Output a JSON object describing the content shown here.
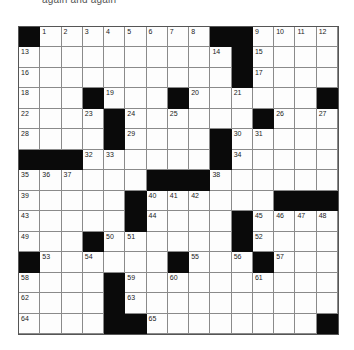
{
  "caption": "again and again",
  "grid": {
    "rows": 15,
    "cols": 15,
    "layout": [
      [
        "#",
        "1",
        "2",
        "3",
        "4",
        "5",
        "6",
        "7",
        "8",
        "#",
        "#",
        "9",
        "10",
        "11",
        "12"
      ],
      [
        "13",
        ".",
        ".",
        ".",
        ".",
        ".",
        ".",
        ".",
        ".",
        "14",
        "#",
        "15",
        ".",
        ".",
        "."
      ],
      [
        "16",
        ".",
        ".",
        ".",
        ".",
        ".",
        ".",
        ".",
        ".",
        ".",
        "#",
        "17",
        ".",
        ".",
        "."
      ],
      [
        "18",
        ".",
        ".",
        "#",
        "19",
        ".",
        ".",
        "#",
        "20",
        ".",
        "21",
        ".",
        ".",
        ".",
        "#"
      ],
      [
        "22",
        ".",
        ".",
        "23",
        "#",
        "24",
        ".",
        "25",
        ".",
        ".",
        ".",
        "#",
        "26",
        ".",
        "27"
      ],
      [
        "28",
        ".",
        ".",
        ".",
        "#",
        "29",
        ".",
        ".",
        ".",
        "#",
        "30",
        "31",
        ".",
        ".",
        "."
      ],
      [
        "#",
        "#",
        "#",
        "32",
        "33",
        ".",
        ".",
        ".",
        ".",
        "#",
        "34",
        ".",
        ".",
        ".",
        "."
      ],
      [
        "35",
        "36",
        "37",
        ".",
        ".",
        ".",
        "#",
        "#",
        "#",
        "38",
        ".",
        ".",
        ".",
        ".",
        "."
      ],
      [
        "39",
        ".",
        ".",
        ".",
        ".",
        "#",
        "40",
        "41",
        "42",
        ".",
        ".",
        ".",
        "#",
        "#",
        "#"
      ],
      [
        "43",
        ".",
        ".",
        ".",
        ".",
        "#",
        "44",
        ".",
        ".",
        ".",
        "#",
        "45",
        "46",
        "47",
        "48"
      ],
      [
        "49",
        ".",
        ".",
        "#",
        "50",
        "51",
        ".",
        ".",
        ".",
        ".",
        "#",
        "52",
        ".",
        ".",
        "."
      ],
      [
        "#",
        "53",
        ".",
        "54",
        ".",
        ".",
        ".",
        "#",
        "55",
        ".",
        "56",
        "#",
        "57",
        ".",
        "."
      ],
      [
        "58",
        ".",
        ".",
        ".",
        "#",
        "59",
        ".",
        "60",
        ".",
        ".",
        ".",
        "61",
        ".",
        ".",
        "."
      ],
      [
        "62",
        ".",
        ".",
        ".",
        "#",
        "63",
        ".",
        ".",
        ".",
        ".",
        ".",
        ".",
        ".",
        ".",
        "."
      ],
      [
        "64",
        ".",
        ".",
        ".",
        "#",
        "#",
        "65",
        ".",
        ".",
        ".",
        ".",
        ".",
        ".",
        ".",
        "#"
      ]
    ]
  }
}
